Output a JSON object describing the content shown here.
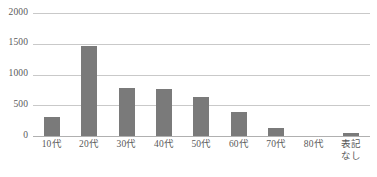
{
  "chart_data": {
    "type": "bar",
    "title": "",
    "subtitle": "",
    "xlabel": "",
    "ylabel": "",
    "categories": [
      "10代",
      "20代",
      "30代",
      "40代",
      "50代",
      "60代",
      "70代",
      "80代",
      "表記\nなし"
    ],
    "values": [
      310,
      1460,
      780,
      765,
      635,
      390,
      135,
      0,
      50
    ],
    "ylim": [
      0,
      2000
    ],
    "yticks": [
      0,
      500,
      1000,
      1500,
      2000
    ],
    "ytick_labels": [
      "0",
      "500",
      "1000",
      "1500",
      "2000"
    ],
    "grid": true,
    "legend": false,
    "legend_position": "none",
    "series": [
      {
        "name": "",
        "values": [
          310,
          1460,
          780,
          765,
          635,
          390,
          135,
          0,
          50
        ]
      }
    ]
  },
  "style": {
    "bar_color": "#7a7a7a",
    "gridline_color": "#c9c9c9",
    "axis_color": "#b0b0b0",
    "text_color": "#595959",
    "background": "#ffffff"
  }
}
